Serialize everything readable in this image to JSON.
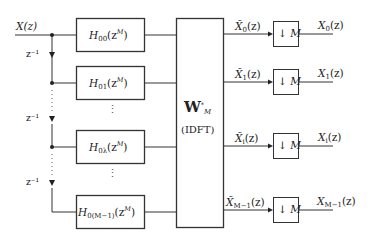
{
  "input": {
    "label": "X(z)"
  },
  "delays": [
    {
      "label": "z⁻¹"
    },
    {
      "label": "z⁻¹"
    },
    {
      "label": "z⁻¹"
    }
  ],
  "filters": [
    {
      "name": "H",
      "sub": "00",
      "arg": "(z",
      "sup": "M",
      "close": ")"
    },
    {
      "name": "H",
      "sub": "01",
      "arg": "(z",
      "sup": "M",
      "close": ")"
    },
    {
      "name": "H",
      "sub": "0λ",
      "arg": "(z",
      "sup": "M",
      "close": ")"
    },
    {
      "name": "H",
      "sub": "0(M−1)",
      "arg": "(z",
      "sup": "M",
      "close": ")"
    }
  ],
  "transform": {
    "symbol": "W",
    "sup": "*",
    "sub": "M",
    "label": "(IDFT)"
  },
  "intermediate": [
    {
      "name": "X̃",
      "sub": "0",
      "arg": "(z)"
    },
    {
      "name": "X̃",
      "sub": "1",
      "arg": "(z)"
    },
    {
      "name": "X̃",
      "sub": "i",
      "arg": "(z)"
    },
    {
      "name": "X̃",
      "sub": "M−1",
      "arg": "(z)"
    }
  ],
  "downsamplers": [
    {
      "arrow": "↓",
      "factor": "M"
    },
    {
      "arrow": "↓",
      "factor": "M"
    },
    {
      "arrow": "↓",
      "factor": "M"
    },
    {
      "arrow": "↓",
      "factor": "M"
    }
  ],
  "outputs": [
    {
      "name": "X",
      "sub": "0",
      "arg": "(z)"
    },
    {
      "name": "X",
      "sub": "1",
      "arg": "(z)"
    },
    {
      "name": "X",
      "sub": "i",
      "arg": "(z)"
    },
    {
      "name": "X",
      "sub": "M−1",
      "arg": "(z)"
    }
  ],
  "ellipsis": "⋮"
}
